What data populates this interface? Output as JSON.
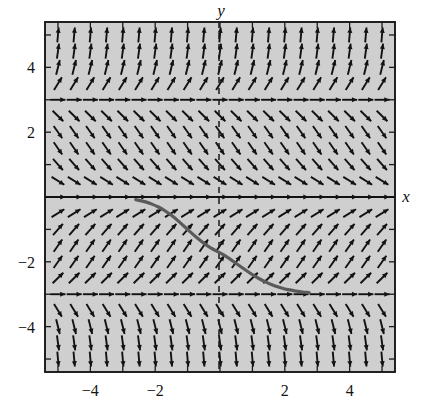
{
  "figure": {
    "kind": "slope-field-with-solution-curve",
    "background_color": "#ffffff",
    "plot_fill_color": "#cfcfcf",
    "frame_color": "#1a1a1a",
    "arrow_color": "#121212",
    "curve_color": "#555555",
    "axis_label_x": "x",
    "axis_label_y": "y"
  },
  "chart_data": {
    "type": "scatter",
    "title": "",
    "xlabel": "x",
    "ylabel": "y",
    "xlim": [
      -5.4,
      5.4
    ],
    "ylim": [
      -5.4,
      5.4
    ],
    "grid": false,
    "legend": null,
    "xticks": [
      -5,
      -4,
      -3,
      -2,
      -1,
      0,
      1,
      2,
      3,
      4,
      5
    ],
    "yticks": [
      -5,
      -4,
      -3,
      -2,
      -1,
      0,
      1,
      2,
      3,
      4,
      5
    ],
    "xtick_labels": [
      "-4",
      "-2",
      "2",
      "4"
    ],
    "xtick_label_values": [
      -4,
      -2,
      2,
      4
    ],
    "ytick_labels": [
      "4",
      "2",
      "-2",
      "-4"
    ],
    "ytick_label_values": [
      4,
      2,
      -2,
      -4
    ],
    "equilibria": [
      0,
      3,
      -3
    ],
    "slope_field": {
      "description": "Direction field of dy/dx = y(y-3)(y+3)/9 style autonomous equation; slope sign positive for -3<y<0 and y>3, negative for 0<y<3 and y<-3",
      "grid_x_start": -5,
      "grid_x_end": 5,
      "grid_y_start": -5,
      "grid_y_end": 5,
      "grid_step": 0.5
    },
    "solution_curve": {
      "name": "solution through (0,-1.5)",
      "x_start": -2.6,
      "x_end": 2.75,
      "y_start": -0.1,
      "y_end": -2.95,
      "points": [
        [
          -2.6,
          -0.08
        ],
        [
          -2.4,
          -0.12
        ],
        [
          -2.2,
          -0.18
        ],
        [
          -2.0,
          -0.26
        ],
        [
          -1.8,
          -0.36
        ],
        [
          -1.6,
          -0.49
        ],
        [
          -1.4,
          -0.64
        ],
        [
          -1.2,
          -0.82
        ],
        [
          -1.0,
          -1.0
        ],
        [
          -0.8,
          -1.18
        ],
        [
          -0.6,
          -1.35
        ],
        [
          -0.4,
          -1.5
        ],
        [
          -0.2,
          -1.62
        ],
        [
          0.0,
          -1.72
        ],
        [
          0.2,
          -1.84
        ],
        [
          0.4,
          -1.98
        ],
        [
          0.6,
          -2.12
        ],
        [
          0.8,
          -2.26
        ],
        [
          1.0,
          -2.4
        ],
        [
          1.2,
          -2.52
        ],
        [
          1.4,
          -2.62
        ],
        [
          1.6,
          -2.71
        ],
        [
          1.8,
          -2.78
        ],
        [
          2.0,
          -2.84
        ],
        [
          2.2,
          -2.88
        ],
        [
          2.4,
          -2.91
        ],
        [
          2.6,
          -2.94
        ],
        [
          2.75,
          -2.95
        ]
      ]
    }
  },
  "labels": {
    "y_axis": "y",
    "x_axis": "x"
  }
}
